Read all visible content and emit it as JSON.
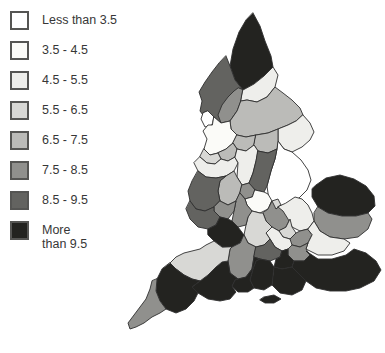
{
  "legend": {
    "swatch_border_color": "#555553",
    "text_color": "#373737",
    "classes": [
      {
        "label": "Less than 3.5",
        "color": "#ffffff"
      },
      {
        "label": "3.5 - 4.5",
        "color": "#fbfbf8"
      },
      {
        "label": "4.5 - 5.5",
        "color": "#eeeeeb"
      },
      {
        "label": "5.5 - 6.5",
        "color": "#d8d8d5"
      },
      {
        "label": "6.5 - 7.5",
        "color": "#bbbbb8"
      },
      {
        "label": "7.5 - 8.5",
        "color": "#90908d"
      },
      {
        "label": "8.5 - 9.5",
        "color": "#636360"
      },
      {
        "label": "More\nthan 9.5",
        "color": "#232320"
      }
    ]
  },
  "map": {
    "type": "choropleth",
    "subject": "England counties",
    "outline_color": "#2f2f2f",
    "outline_width": 0.9,
    "regions": [
      {
        "name": "northumberland",
        "class": 7,
        "points": "253,13 260,26 265,41 271,56 273,67 264,76 254,84 243,90 235,80 230,66 233,49 239,32 246,20"
      },
      {
        "name": "cumbria",
        "class": 6,
        "points": "226,56 230,66 235,80 243,90 241,101 237,111 230,121 221,123 214,117 206,119 200,111 202,101 199,92 205,82 212,72 219,63"
      },
      {
        "name": "westmorland",
        "class": 5,
        "points": "243,90 241,101 237,111 230,121 221,123 218,115 222,105 228,97 234,91 238,88"
      },
      {
        "name": "furness",
        "class": 0,
        "points": "208,111 214,117 212,125 205,127 201,119 203,113"
      },
      {
        "name": "durham",
        "class": 2,
        "points": "243,90 254,84 264,76 273,67 278,75 275,87 267,97 257,102 247,100 241,101"
      },
      {
        "name": "north-yorkshire",
        "class": 4,
        "points": "241,101 247,100 257,102 267,97 275,87 283,93 292,100 300,108 303,115 296,121 288,125 278,129 268,133 256,135 246,137 237,135 231,129 230,121 237,111"
      },
      {
        "name": "east-riding",
        "class": 2,
        "points": "303,115 310,123 314,132 310,140 302,147 292,152 284,149 278,141 278,129 288,125 296,121"
      },
      {
        "name": "lincolnshire",
        "class": 0,
        "points": "278,141 284,149 292,152 301,160 308,170 311,180 307,190 299,198 290,204 281,208 274,210 269,200 267,186 271,171 275,159 277,149"
      },
      {
        "name": "lancashire",
        "class": 1,
        "points": "214,117 221,123 230,121 231,129 237,135 233,143 226,149 218,153 210,155 204,149 207,139 203,131 208,125 212,125"
      },
      {
        "name": "west-yorkshire",
        "class": 4,
        "points": "237,135 246,137 256,135 254,145 246,151 237,149 233,143"
      },
      {
        "name": "south-yorkshire",
        "class": 4,
        "points": "256,135 268,133 278,129 278,141 277,149 268,153 258,151 254,145"
      },
      {
        "name": "greater-manchester",
        "class": 4,
        "points": "226,149 233,143 237,149 235,157 228,161 221,159 218,153"
      },
      {
        "name": "merseyside",
        "class": 3,
        "points": "204,149 210,155 218,153 221,159 215,164 207,163 200,157"
      },
      {
        "name": "cheshire",
        "class": 2,
        "points": "200,157 207,163 215,164 221,159 228,161 235,157 238,163 234,171 226,176 216,178 206,177 198,171 194,163"
      },
      {
        "name": "derbyshire",
        "class": 2,
        "points": "235,157 237,149 246,151 254,145 258,151 256,161 253,173 249,183 242,185 237,177 238,163"
      },
      {
        "name": "nottinghamshire",
        "class": 6,
        "points": "258,151 268,153 277,149 275,159 271,171 267,186 264,192 255,190 249,183 253,173 256,161"
      },
      {
        "name": "staffordshire",
        "class": 4,
        "points": "226,176 234,171 237,177 242,185 240,193 236,201 228,205 220,201 218,191 220,181"
      },
      {
        "name": "shropshire",
        "class": 6,
        "points": "198,171 206,177 216,178 226,176 220,181 218,191 220,201 214,207 205,211 196,209 190,201 188,191 192,181"
      },
      {
        "name": "west-midlands",
        "class": 5,
        "points": "242,185 249,183 255,190 252,197 245,199 240,193"
      },
      {
        "name": "leicestershire",
        "class": 1,
        "points": "255,190 264,192 268,194 272,201 268,209 260,213 252,211 247,205 245,199 252,197"
      },
      {
        "name": "rutland",
        "class": 3,
        "points": "272,201 278,199 281,205 276,209 270,206"
      },
      {
        "name": "northamptonshire",
        "class": 5,
        "points": "268,209 272,201 276,209 281,205 286,211 290,219 286,227 279,231 272,227 266,221 263,213"
      },
      {
        "name": "norfolk",
        "class": 7,
        "points": "316,185 326,178 340,175 354,179 366,186 374,196 375,206 368,213 356,216 342,216 328,213 318,207 312,197 312,189"
      },
      {
        "name": "suffolk",
        "class": 5,
        "points": "318,207 328,213 342,216 356,216 368,213 372,219 368,229 358,237 344,239 330,237 320,231 314,221 314,213"
      },
      {
        "name": "cambridgeshire",
        "class": 2,
        "points": "286,203 295,197 302,199 308,205 312,213 314,221 308,229 300,231 292,227 288,219 283,211 278,207"
      },
      {
        "name": "bedfordshire",
        "class": 3,
        "points": "286,227 290,219 292,227 296,233 290,239 283,237 279,231"
      },
      {
        "name": "hertfordshire",
        "class": 5,
        "points": "290,239 296,233 300,231 308,229 312,235 308,243 300,247 292,245"
      },
      {
        "name": "essex",
        "class": 2,
        "points": "308,229 314,221 320,231 330,237 344,239 350,243 344,251 332,255 318,255 306,249 308,243 312,235"
      },
      {
        "name": "greater-london",
        "class": 5,
        "points": "292,245 300,247 308,243 306,249 310,255 304,261 294,261 288,255 288,249"
      },
      {
        "name": "buckinghamshire",
        "class": 2,
        "points": "272,227 279,231 283,237 290,239 292,245 288,249 282,251 275,247 270,239 266,233"
      },
      {
        "name": "oxfordshire",
        "class": 3,
        "points": "252,211 260,213 263,213 266,221 272,227 266,233 270,239 264,245 256,247 248,243 244,235 246,225 248,217"
      },
      {
        "name": "warwickshire",
        "class": 5,
        "points": "240,193 245,199 247,205 252,211 248,217 246,225 238,227 232,221 234,211 236,201"
      },
      {
        "name": "worcestershire",
        "class": 5,
        "points": "220,201 228,205 236,201 234,211 228,219 220,217 214,211 214,207"
      },
      {
        "name": "herefordshire",
        "class": 6,
        "points": "190,201 196,209 205,211 214,207 214,211 220,217 216,225 208,229 198,227 190,219 186,209"
      },
      {
        "name": "gloucestershire",
        "class": 7,
        "points": "208,229 216,225 220,217 228,219 232,221 238,227 244,235 240,243 232,247 222,247 214,241 208,235"
      },
      {
        "name": "wiltshire",
        "class": 5,
        "points": "244,235 248,243 256,247 254,257 252,269 246,277 238,279 230,273 228,261 230,249 232,247 240,243"
      },
      {
        "name": "berkshire",
        "class": 6,
        "points": "256,247 264,245 270,239 275,247 282,251 280,257 270,261 260,259 254,257"
      },
      {
        "name": "surrey",
        "class": 7,
        "points": "282,251 288,249 288,255 294,261 292,267 282,269 274,267 276,259 280,257"
      },
      {
        "name": "kent",
        "class": 7,
        "points": "292,267 294,261 304,261 310,255 306,251 318,259 332,259 346,255 354,249 366,253 376,261 381,270 374,281 360,288 346,291 330,291 316,288 306,281 298,273"
      },
      {
        "name": "east-sussex",
        "class": 7,
        "points": "274,267 282,269 292,267 298,273 306,281 302,290 292,295 280,293 272,285"
      },
      {
        "name": "west-sussex",
        "class": 7,
        "points": "256,261 260,259 270,261 274,267 272,285 264,290 254,288 250,280 253,269"
      },
      {
        "name": "hampshire",
        "class": 7,
        "points": "246,277 252,269 254,257 260,259 256,261 253,269 250,280 254,288 248,292 238,292 232,286 235,280 238,279"
      },
      {
        "name": "isle-of-wight",
        "class": 7,
        "points": "264,297 274,295 281,299 274,303 265,303 260,300"
      },
      {
        "name": "dorset",
        "class": 7,
        "points": "228,261 230,273 238,279 235,280 232,286 236,292 230,299 220,301 208,299 198,293 192,287 200,281 208,275 216,267 222,262"
      },
      {
        "name": "somerset",
        "class": 3,
        "points": "232,247 230,249 228,261 222,262 216,267 208,275 200,281 192,279 184,275 176,269 170,263 176,257 184,253 192,251 200,249 206,245 214,241 222,247"
      },
      {
        "name": "devon",
        "class": 7,
        "points": "170,263 176,269 184,275 192,279 200,281 192,287 198,293 194,301 186,309 176,313 166,309 160,301 156,291 157,279 162,269"
      },
      {
        "name": "cornwall",
        "class": 5,
        "points": "157,279 156,291 160,301 166,309 160,313 152,317 144,323 136,327 130,329 128,323 134,315 140,307 146,299 150,289 152,281"
      }
    ]
  }
}
